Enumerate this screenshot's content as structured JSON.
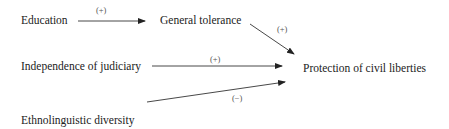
{
  "diagram": {
    "type": "causal path diagram",
    "nodes": {
      "education": "Education",
      "general_tolerance": "General tolerance",
      "independence_of_judiciary": "Independence of judiciary",
      "ethnolinguistic_diversity": "Ethnolinguistic diversity",
      "protection_of_civil_liberties": "Protection of civil liberties"
    },
    "edges": [
      {
        "from": "Education",
        "to": "General tolerance",
        "sign": "(+)"
      },
      {
        "from": "General tolerance",
        "to": "Protection of civil liberties",
        "sign": "(+)"
      },
      {
        "from": "Independence of judiciary",
        "to": "Protection of civil liberties",
        "sign": "(+)"
      },
      {
        "from": "Ethnolinguistic diversity",
        "to": "Protection of civil liberties",
        "sign": "(−)"
      }
    ]
  }
}
